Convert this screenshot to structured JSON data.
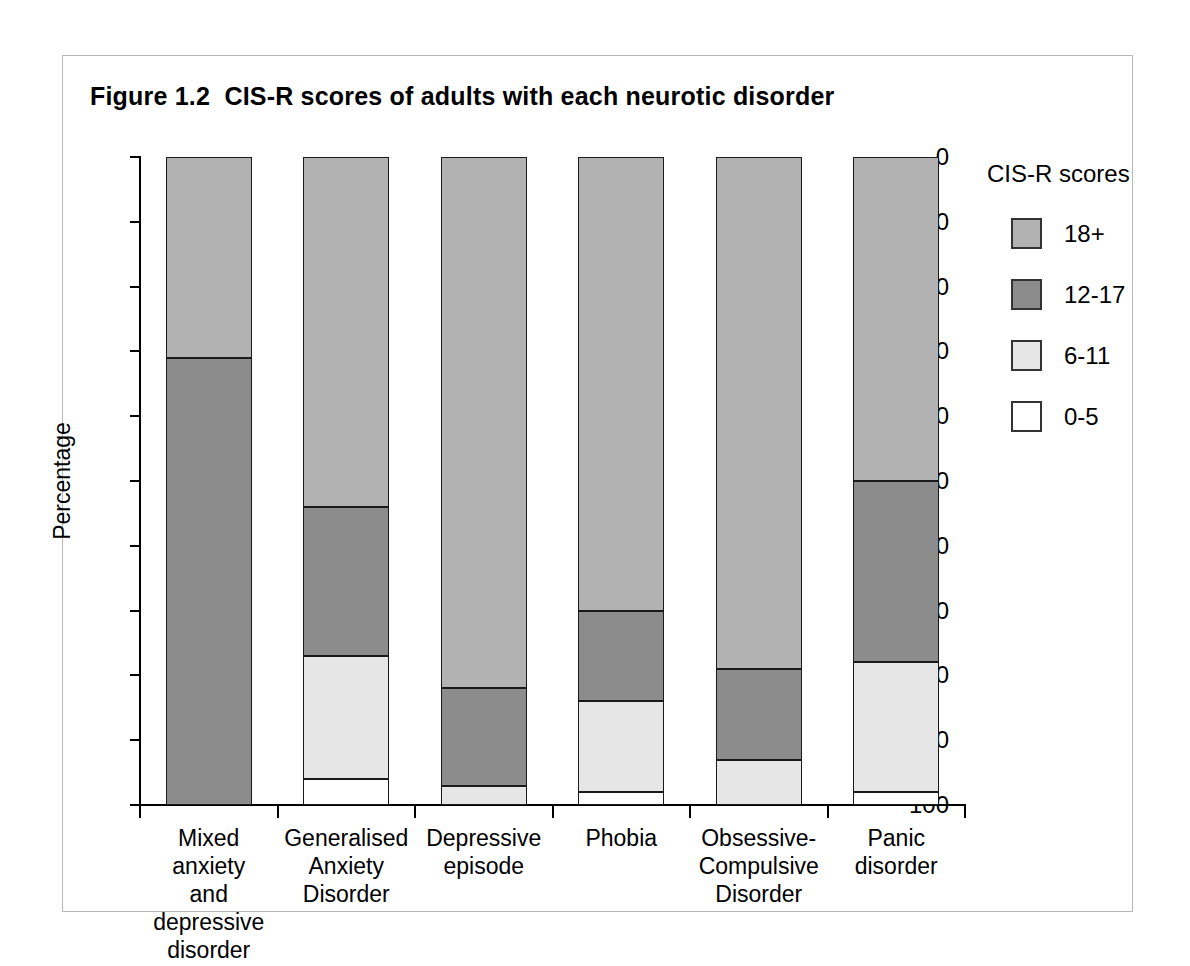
{
  "figure": {
    "title": "Figure 1.2  CIS-R scores of adults with each neurotic disorder",
    "frame_border_color": "#b9b9b9",
    "background": "#ffffff"
  },
  "legend": {
    "title": "CIS-R scores",
    "position": "right",
    "items": [
      {
        "label": "18+",
        "color": "#b2b2b2"
      },
      {
        "label": "12-17",
        "color": "#8c8c8c"
      },
      {
        "label": "6-11",
        "color": "#e6e6e6"
      },
      {
        "label": "0-5",
        "color": "#ffffff"
      }
    ]
  },
  "axes": {
    "ylabel": "Percentage",
    "xlabel": "",
    "yticks": [
      "100",
      "90",
      "80",
      "70",
      "60",
      "50",
      "40",
      "30",
      "20",
      "10",
      "0"
    ],
    "ytick_values": [
      100,
      90,
      80,
      70,
      60,
      50,
      40,
      30,
      20,
      10,
      0
    ],
    "ylim": [
      0,
      100
    ],
    "grid": false
  },
  "chart_data": {
    "type": "bar",
    "subtype": "stacked-vertical-100pct",
    "title": "Figure 1.2  CIS-R scores of adults with each neurotic disorder",
    "xlabel": "",
    "ylabel": "Percentage",
    "ylim": [
      0,
      100
    ],
    "yticks": [
      0,
      10,
      20,
      30,
      40,
      50,
      60,
      70,
      80,
      90,
      100
    ],
    "grid": false,
    "legend_title": "CIS-R scores",
    "legend_position": "right",
    "categories": [
      "Mixed anxiety and depressive disorder",
      "Generalised Anxiety Disorder",
      "Depressive episode",
      "Phobia",
      "Obsessive-Compulsive Disorder",
      "Panic disorder"
    ],
    "category_label_lines": [
      [
        "Mixed anxiety",
        "and",
        "depressive",
        "disorder"
      ],
      [
        "Generalised",
        "Anxiety",
        "Disorder"
      ],
      [
        "Depressive",
        "episode"
      ],
      [
        "Phobia"
      ],
      [
        "Obsessive-",
        "Compulsive",
        "Disorder"
      ],
      [
        "Panic disorder"
      ]
    ],
    "series": [
      {
        "name": "0-5",
        "color": "#ffffff",
        "values": [
          0,
          4,
          0,
          2,
          0,
          2
        ]
      },
      {
        "name": "6-11",
        "color": "#e6e6e6",
        "values": [
          0,
          19,
          3,
          14,
          7,
          20
        ]
      },
      {
        "name": "12-17",
        "color": "#8c8c8c",
        "values": [
          69,
          23,
          15,
          14,
          14,
          28
        ]
      },
      {
        "name": "18+",
        "color": "#b2b2b2",
        "values": [
          31,
          54,
          82,
          70,
          79,
          50
        ]
      }
    ],
    "cumulative_tops": {
      "0-5": [
        0,
        4,
        0,
        2,
        0,
        2
      ],
      "6-11": [
        0,
        23,
        3,
        16,
        7,
        22
      ],
      "12-17": [
        69,
        46,
        18,
        30,
        21,
        50
      ],
      "18+": [
        100,
        100,
        100,
        100,
        100,
        100
      ]
    }
  }
}
